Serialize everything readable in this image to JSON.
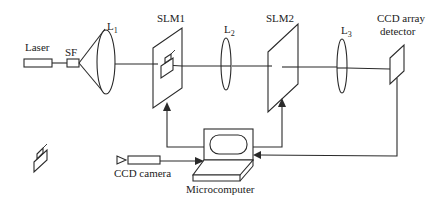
{
  "diagram": {
    "labels": {
      "laser": "Laser",
      "sf": "SF",
      "l1_main": "L",
      "l1_sub": "1",
      "slm1": "SLM1",
      "l2_main": "L",
      "l2_sub": "2",
      "slm2": "SLM2",
      "l3_main": "L",
      "l3_sub": "3",
      "ccd_array_line1": "CCD array",
      "ccd_array_line2": "detector",
      "ccd_camera": "CCD camera",
      "microcomputer": "Microcomputer"
    },
    "components": [
      {
        "id": "laser",
        "type": "light-source"
      },
      {
        "id": "sf",
        "type": "spatial-filter"
      },
      {
        "id": "l1",
        "type": "collimating-lens"
      },
      {
        "id": "slm1",
        "type": "spatial-light-modulator"
      },
      {
        "id": "l2",
        "type": "fourier-lens"
      },
      {
        "id": "slm2",
        "type": "spatial-light-modulator"
      },
      {
        "id": "l3",
        "type": "fourier-lens"
      },
      {
        "id": "ccd_array",
        "type": "detector"
      },
      {
        "id": "ccd_camera",
        "type": "camera"
      },
      {
        "id": "microcomputer",
        "type": "computer"
      },
      {
        "id": "object",
        "type": "input-object"
      }
    ],
    "connections": [
      {
        "from": "laser",
        "to": "sf"
      },
      {
        "from": "sf",
        "to": "l1"
      },
      {
        "from": "l1",
        "to": "slm1"
      },
      {
        "from": "slm1",
        "to": "l2"
      },
      {
        "from": "l2",
        "to": "slm2"
      },
      {
        "from": "slm2",
        "to": "l3"
      },
      {
        "from": "l3",
        "to": "ccd_array"
      },
      {
        "from": "microcomputer",
        "to": "slm1"
      },
      {
        "from": "microcomputer",
        "to": "slm2"
      },
      {
        "from": "ccd_camera",
        "to": "microcomputer"
      },
      {
        "from": "ccd_array",
        "to": "microcomputer"
      }
    ],
    "colors": {
      "line": "#2a2a2a",
      "background": "#ffffff"
    }
  }
}
